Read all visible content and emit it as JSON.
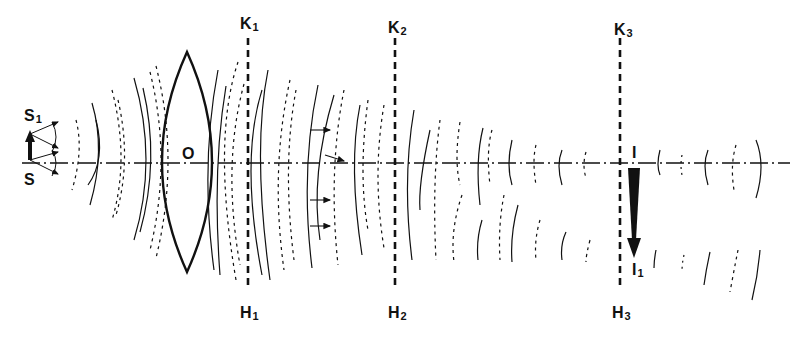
{
  "figure": {
    "colors": {
      "ink": "#111111",
      "background": "#ffffff"
    }
  },
  "labels": {
    "object_top": {
      "main": "S",
      "sub": "1"
    },
    "object_base": {
      "main": "S",
      "sub": ""
    },
    "lens": {
      "main": "O",
      "sub": ""
    },
    "plane1_top": {
      "main": "K",
      "sub": "1"
    },
    "plane1_bottom": {
      "main": "H",
      "sub": "1"
    },
    "plane2_top": {
      "main": "K",
      "sub": "2"
    },
    "plane2_bottom": {
      "main": "H",
      "sub": "2"
    },
    "plane3_top": {
      "main": "K",
      "sub": "3"
    },
    "plane3_bottom": {
      "main": "H",
      "sub": "3"
    },
    "image_base": {
      "main": "I",
      "sub": ""
    },
    "image_tip": {
      "main": "I",
      "sub": "1"
    }
  },
  "elements": {
    "optical_axis_y": 163,
    "object_arrow": {
      "x": 30,
      "y_base": 160,
      "y_tip": 132
    },
    "lens": {
      "x_center": 187,
      "y_top": 52,
      "y_bottom": 272,
      "half_width": 25
    },
    "planes": [
      {
        "id": "K1H1",
        "x": 248,
        "y_top": 38,
        "y_bottom": 290
      },
      {
        "id": "K2H2",
        "x": 395,
        "y_top": 38,
        "y_bottom": 290
      },
      {
        "id": "K3H3",
        "x": 620,
        "y_top": 38,
        "y_bottom": 290
      }
    ],
    "image_arrow": {
      "x": 634,
      "y_base": 168,
      "y_tip": 258
    }
  }
}
